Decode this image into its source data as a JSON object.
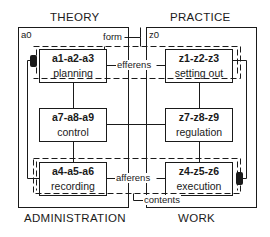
{
  "headers": {
    "top_left": "THEORY",
    "top_right": "PRACTICE",
    "bottom_left": "ADMINISTRATION",
    "bottom_right": "WORK"
  },
  "frames": {
    "left_label": "a0",
    "right_label": "z0"
  },
  "boxes": {
    "planning": {
      "code": "a1-a2-a3",
      "name": "planning"
    },
    "control": {
      "code": "a7-a8-a9",
      "name": "control"
    },
    "recording": {
      "code": "a4-a5-a6",
      "name": "recording"
    },
    "setting_out": {
      "code": "z1-z2-z3",
      "name": "setting out"
    },
    "regulation": {
      "code": "z7-z8-z9",
      "name": "regulation"
    },
    "execution": {
      "code": "z4-z5-z6",
      "name": "execution"
    }
  },
  "connectors": {
    "form": "form",
    "efferens": "efferens",
    "afferens": "afferens",
    "contents": "contents"
  },
  "colors": {
    "line": "#1a1a1a",
    "background": "#ffffff"
  }
}
